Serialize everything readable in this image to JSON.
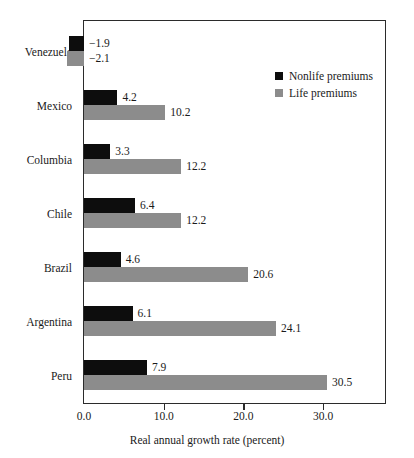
{
  "chart_data": {
    "type": "bar",
    "orientation": "horizontal",
    "title": "",
    "xlabel": "Real annual growth rate (percent)",
    "ylabel": "",
    "categories": [
      "Venezuela",
      "Mexico",
      "Columbia",
      "Chile",
      "Brazil",
      "Argentina",
      "Peru"
    ],
    "series": [
      {
        "name": "Nonlife premiums",
        "color": "#0d0d0d",
        "values": [
          -1.9,
          4.2,
          3.3,
          6.4,
          4.6,
          6.1,
          7.9
        ],
        "labels": [
          "−1.9",
          "4.2",
          "3.3",
          "6.4",
          "4.6",
          "6.1",
          "7.9"
        ]
      },
      {
        "name": "Life premiums",
        "color": "#8c8c8c",
        "values": [
          -2.1,
          10.2,
          12.2,
          12.2,
          20.6,
          24.1,
          30.5
        ],
        "labels": [
          "−2.1",
          "10.2",
          "12.2",
          "12.2",
          "20.6",
          "24.1",
          "30.5"
        ]
      }
    ],
    "xticks": [
      0.0,
      10.0,
      20.0,
      30.0
    ],
    "xtick_labels": [
      "0.0",
      "10.0",
      "20.0",
      "30.0"
    ],
    "xlim": [
      0.0,
      38.0
    ],
    "grid": false,
    "legend_position": "top-right",
    "legend_entries": [
      "Nonlife premiums",
      "Life premiums"
    ]
  },
  "legend": {
    "items": [
      {
        "label": "Nonlife premiums",
        "swatch": "nonlife-swatch-icon"
      },
      {
        "label": "Life premiums",
        "swatch": "life-swatch-icon"
      }
    ]
  },
  "axis": {
    "title": "Real annual growth rate (percent)",
    "tick_labels": [
      "0.0",
      "10.0",
      "20.0",
      "30.0"
    ]
  }
}
